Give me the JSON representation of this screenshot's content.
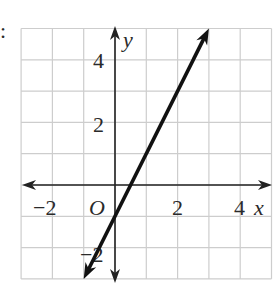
{
  "chart_data": {
    "type": "line",
    "title": "",
    "xlabel": "x",
    "ylabel": "y",
    "xlim": [
      -3,
      5
    ],
    "ylim": [
      -3,
      5
    ],
    "grid": true,
    "x_tick_labels": [
      "−2",
      "2",
      "4"
    ],
    "y_tick_labels": [
      "4",
      "2",
      "−2"
    ],
    "origin_label": "O",
    "series": [
      {
        "name": "line",
        "equation": "y = 2x − 1",
        "x": [
          -1,
          0,
          0.5,
          1,
          2,
          3
        ],
        "y": [
          -3,
          -1,
          0,
          1,
          3,
          5
        ],
        "arrows_both_ends": true
      }
    ]
  },
  "leading_mark": ":",
  "colors": {
    "grid": "#c8c8c8",
    "axes": "#222222",
    "line": "#111111"
  }
}
